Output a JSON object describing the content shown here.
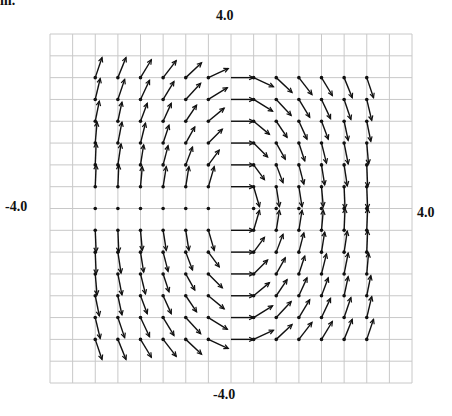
{
  "corner_text": "m.",
  "labels": {
    "top": "4.0",
    "bottom": "-4.0",
    "left": "-4.0",
    "right": "4.0"
  },
  "colors": {
    "grid": "#c8c8c8",
    "arrow": "#111111",
    "background": "#ffffff"
  },
  "chart_data": {
    "type": "scatter",
    "kind": "vector-field",
    "title": "",
    "xlabel": "",
    "ylabel": "",
    "xlim": [
      -4.0,
      4.0
    ],
    "ylim": [
      -4.0,
      4.0
    ],
    "axis_tick_labels": {
      "x_min": "-4.0",
      "x_max": "4.0",
      "y_min": "-4.0",
      "y_max": "4.0"
    },
    "grid": true,
    "grid_step": 0.5,
    "legend": null,
    "x": [
      -3,
      -2.5,
      -2,
      -1.5,
      -1,
      -0.5,
      0,
      0.5,
      1,
      1.5,
      2,
      2.5,
      3
    ],
    "rows": [
      {
        "y": 3,
        "u": [
          0.15,
          0.18,
          0.24,
          0.29,
          0.35,
          0.44,
          0.5,
          0.44,
          0.35,
          0.29,
          0.24,
          0.18,
          0.15
        ],
        "v": [
          0.46,
          0.46,
          0.41,
          0.39,
          0.34,
          0.21,
          0,
          -0.21,
          -0.34,
          -0.39,
          -0.41,
          -0.46,
          -0.46
        ]
      },
      {
        "y": 2.5,
        "u": [
          0.11,
          0.15,
          0.2,
          0.24,
          0.33,
          0.42,
          0.5,
          0.42,
          0.33,
          0.24,
          0.2,
          0.15,
          0.11
        ],
        "v": [
          0.48,
          0.46,
          0.44,
          0.41,
          0.37,
          0.27,
          0,
          -0.27,
          -0.37,
          -0.41,
          -0.44,
          -0.46,
          -0.48
        ]
      },
      {
        "y": 2,
        "u": [
          0.09,
          0.09,
          0.15,
          0.18,
          0.24,
          0.35,
          0.5,
          0.35,
          0.24,
          0.18,
          0.15,
          0.09,
          0.09
        ],
        "v": [
          0.46,
          0.44,
          0.41,
          0.41,
          0.37,
          0.3,
          0,
          -0.3,
          -0.37,
          -0.41,
          -0.41,
          -0.44,
          -0.46
        ]
      },
      {
        "y": 1.5,
        "u": [
          0.04,
          0.09,
          0.11,
          0.13,
          0.2,
          0.31,
          0.5,
          0.31,
          0.2,
          0.13,
          0.11,
          0.09,
          0.04
        ],
        "v": [
          0.48,
          0.48,
          0.46,
          0.41,
          0.37,
          0.32,
          0,
          -0.32,
          -0.37,
          -0.41,
          -0.46,
          -0.48,
          -0.48
        ]
      },
      {
        "y": 1,
        "u": [
          0.02,
          0.07,
          0.07,
          0.11,
          0.15,
          0.24,
          0.5,
          0.24,
          0.15,
          0.11,
          0.07,
          0.07,
          0.02
        ],
        "v": [
          0.5,
          0.48,
          0.46,
          0.44,
          0.41,
          0.34,
          0,
          -0.34,
          -0.41,
          -0.44,
          -0.46,
          -0.48,
          -0.5
        ]
      },
      {
        "y": 0.5,
        "u": [
          0.02,
          0.02,
          0.04,
          0.07,
          0.07,
          0.13,
          0.5,
          0.13,
          0.07,
          0.07,
          0.04,
          0.02,
          0.02
        ],
        "v": [
          0.5,
          0.5,
          0.46,
          0.46,
          0.46,
          0.46,
          0,
          -0.46,
          -0.46,
          -0.46,
          -0.46,
          -0.5,
          -0.5
        ]
      },
      {
        "y": 0,
        "u": [
          0,
          0,
          0,
          0,
          0,
          0,
          null,
          0,
          0,
          0,
          0,
          0,
          0
        ],
        "v": [
          0,
          0,
          0,
          0,
          0,
          0,
          null,
          0,
          0,
          0,
          0,
          0,
          0
        ]
      },
      {
        "y": -0.5,
        "u": [
          0.02,
          0.02,
          0.04,
          0.07,
          0.07,
          0.13,
          0.5,
          0.13,
          0.07,
          0.07,
          0.04,
          0.02,
          0.02
        ],
        "v": [
          -0.5,
          -0.5,
          -0.46,
          -0.46,
          -0.46,
          -0.46,
          0,
          0.46,
          0.46,
          0.46,
          0.46,
          0.5,
          0.5
        ]
      },
      {
        "y": -1,
        "u": [
          0.02,
          0.07,
          0.07,
          0.11,
          0.15,
          0.24,
          0.5,
          0.24,
          0.15,
          0.11,
          0.07,
          0.07,
          0.02
        ],
        "v": [
          -0.5,
          -0.48,
          -0.46,
          -0.44,
          -0.41,
          -0.34,
          0,
          0.34,
          0.41,
          0.44,
          0.46,
          0.48,
          0.5
        ]
      },
      {
        "y": -1.5,
        "u": [
          0.04,
          0.09,
          0.11,
          0.13,
          0.2,
          0.31,
          0.5,
          0.31,
          0.2,
          0.13,
          0.11,
          0.09,
          0.04
        ],
        "v": [
          -0.48,
          -0.48,
          -0.46,
          -0.41,
          -0.37,
          -0.32,
          0,
          0.32,
          0.37,
          0.41,
          0.46,
          0.48,
          0.48
        ]
      },
      {
        "y": -2,
        "u": [
          0.09,
          0.09,
          0.15,
          0.18,
          0.24,
          0.35,
          0.5,
          0.35,
          0.24,
          0.18,
          0.15,
          0.09,
          0.09
        ],
        "v": [
          -0.46,
          -0.44,
          -0.41,
          -0.41,
          -0.37,
          -0.3,
          0,
          0.3,
          0.37,
          0.41,
          0.41,
          0.44,
          0.46
        ]
      },
      {
        "y": -2.5,
        "u": [
          0.11,
          0.15,
          0.2,
          0.24,
          0.33,
          0.42,
          0.5,
          0.42,
          0.33,
          0.24,
          0.2,
          0.15,
          0.11
        ],
        "v": [
          -0.48,
          -0.46,
          -0.44,
          -0.41,
          -0.37,
          -0.27,
          0,
          0.27,
          0.37,
          0.41,
          0.44,
          0.46,
          0.48
        ]
      },
      {
        "y": -3,
        "u": [
          0.15,
          0.18,
          0.24,
          0.29,
          0.35,
          0.44,
          0.5,
          0.44,
          0.35,
          0.29,
          0.24,
          0.18,
          0.15
        ],
        "v": [
          -0.46,
          -0.46,
          -0.41,
          -0.39,
          -0.34,
          -0.21,
          0,
          0.21,
          0.34,
          0.39,
          0.41,
          0.46,
          0.46
        ]
      }
    ]
  }
}
